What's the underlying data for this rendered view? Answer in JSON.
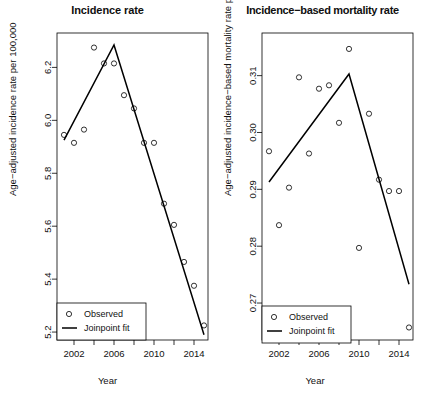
{
  "figure": {
    "xlabel": "Year",
    "legend": {
      "observed_label": "Observed",
      "fit_label": "Joinpoint fit"
    }
  },
  "chart_data": [
    {
      "type": "scatter",
      "panel": "left",
      "title": "Incidence rate",
      "xlabel": "Year",
      "ylabel": "Age−adjusted incidence rate per 100,000",
      "xlim": [
        2000.3,
        2015.4
      ],
      "ylim": [
        5.17,
        6.33
      ],
      "xticks": [
        2002,
        2006,
        2010,
        2014
      ],
      "xtick_labels": [
        "2002",
        "2006",
        "2010",
        "2014"
      ],
      "xminorticks": [
        2000,
        2004,
        2008,
        2012
      ],
      "yticks": [
        5.2,
        5.4,
        5.6,
        5.8,
        6.0,
        6.2
      ],
      "ytick_labels": [
        "5.2",
        "5.4",
        "5.6",
        "5.8",
        "6.0",
        "6.2"
      ],
      "grid": false,
      "legend_position": "bottom-left",
      "series": [
        {
          "name": "Observed",
          "marker": "open-circle",
          "x": [
            2001,
            2002,
            2003,
            2004,
            2005,
            2006,
            2007,
            2008,
            2009,
            2010,
            2011,
            2012,
            2013,
            2014,
            2015
          ],
          "y": [
            5.945,
            5.915,
            5.965,
            6.275,
            6.215,
            6.215,
            6.095,
            6.045,
            5.915,
            5.915,
            5.685,
            5.605,
            5.465,
            5.375,
            5.225
          ]
        },
        {
          "name": "Joinpoint fit",
          "type": "line",
          "joinpoints": [
            {
              "x": 2001,
              "y": 5.925
            },
            {
              "x": 2006,
              "y": 6.285
            },
            {
              "x": 2015,
              "y": 5.19
            }
          ]
        }
      ]
    },
    {
      "type": "scatter",
      "panel": "right",
      "title": "Incidence−based mortality rate",
      "xlabel": "Year",
      "ylabel": "Age−adjusted incidence−based mortality rate per 100,000",
      "xlim": [
        2000.3,
        2015.4
      ],
      "ylim": [
        0.2635,
        0.3175
      ],
      "xticks": [
        2002,
        2006,
        2010,
        2014
      ],
      "xtick_labels": [
        "2002",
        "2006",
        "2010",
        "2014"
      ],
      "xminorticks": [
        2000,
        2004,
        2008,
        2012
      ],
      "yticks": [
        0.27,
        0.28,
        0.29,
        0.3,
        0.31
      ],
      "ytick_labels": [
        "0.27",
        "0.28",
        "0.29",
        "0.30",
        "0.31"
      ],
      "grid": false,
      "legend_position": "bottom-left",
      "series": [
        {
          "name": "Observed",
          "marker": "open-circle",
          "x": [
            2001,
            2002,
            2003,
            2004,
            2005,
            2006,
            2007,
            2008,
            2009,
            2010,
            2011,
            2012,
            2013,
            2014,
            2015
          ],
          "y": [
            0.2967,
            0.2837,
            0.2903,
            0.3097,
            0.2963,
            0.3077,
            0.3083,
            0.3017,
            0.3147,
            0.2797,
            0.3033,
            0.2917,
            0.2897,
            0.2897,
            0.2657
          ]
        },
        {
          "name": "Joinpoint fit",
          "type": "line",
          "joinpoints": [
            {
              "x": 2001,
              "y": 0.2913
            },
            {
              "x": 2009,
              "y": 0.3103
            },
            {
              "x": 2015,
              "y": 0.2733
            }
          ]
        }
      ]
    }
  ]
}
